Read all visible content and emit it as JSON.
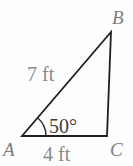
{
  "diagram": {
    "type": "triangle-figure",
    "vertices": {
      "bottom_left": "A",
      "top_right": "B",
      "bottom_right": "C"
    },
    "sides": {
      "hypotenuse_AB_label": "7 ft",
      "base_AC_label": "4 ft"
    },
    "angle": {
      "at_vertex": "A",
      "label": "50°"
    },
    "colors": {
      "line": "#1f1f1f",
      "side_label": "#8a8a8a",
      "vertex_label": "#7d7d7d",
      "angle_label": "#3f3f3f",
      "background": "#fdfdfd"
    }
  }
}
